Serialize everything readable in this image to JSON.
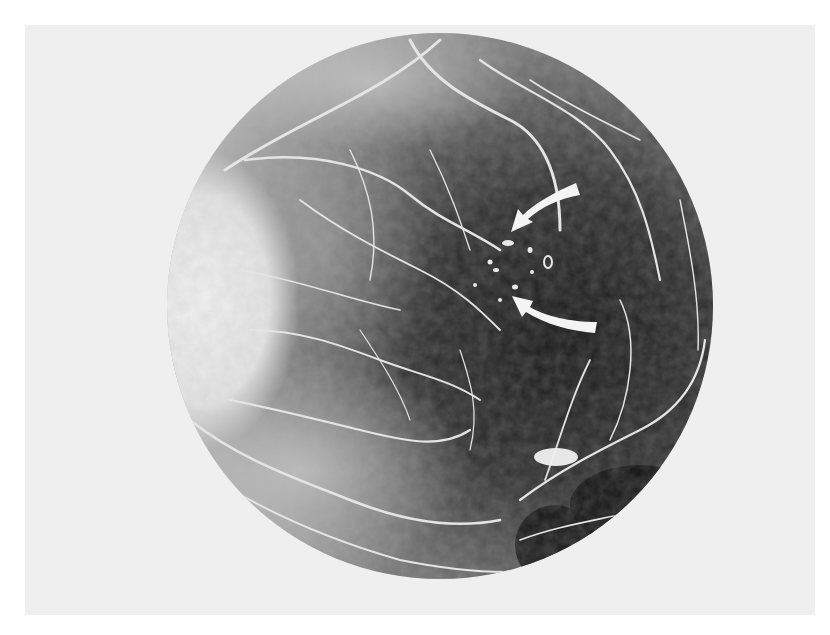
{
  "figure": {
    "background_color": "#efefef",
    "page_color": "#ffffff",
    "fundus": {
      "center_x": 440,
      "center_y": 306,
      "radius": 273,
      "dark_tone": "#1c1c1c",
      "mid_tone": "#6a6a6a",
      "light_tone": "#d8d8d8",
      "vessel_color": "#e6e6e6"
    },
    "optic_disc": {
      "x": 200,
      "y": 300,
      "rx": 95,
      "ry": 140,
      "color": "#ececec"
    },
    "annotations": {
      "arrows": [
        {
          "name": "upper-arrow",
          "tip": [
            513,
            228
          ],
          "tail": [
            576,
            190
          ],
          "color": "#f4f4f4"
        },
        {
          "name": "lower-arrow",
          "tip": [
            516,
            295
          ],
          "tail": [
            596,
            327
          ],
          "color": "#f4f4f4"
        }
      ],
      "leakage_spots_label": "hyperfluorescent leakage points"
    }
  }
}
